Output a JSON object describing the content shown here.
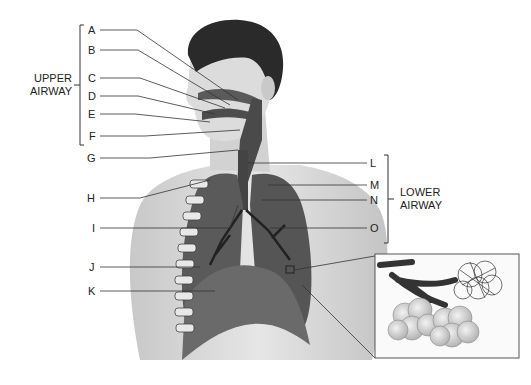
{
  "groups": {
    "upper": {
      "line1": "UPPER",
      "line2": "AIRWAY"
    },
    "lower": {
      "line1": "LOWER",
      "line2": "AIRWAY"
    }
  },
  "labels": {
    "A": "A",
    "B": "B",
    "C": "C",
    "D": "D",
    "E": "E",
    "F": "F",
    "G": "G",
    "H": "H",
    "I": "I",
    "J": "J",
    "K": "K",
    "L": "L",
    "M": "M",
    "N": "N",
    "O": "O"
  },
  "inset": {
    "content": "alveoli-detail"
  },
  "colors": {
    "line": "#333333",
    "skin": "#d9d9d9",
    "lung": "#5a5a5a",
    "hair": "#2a2a2a"
  }
}
